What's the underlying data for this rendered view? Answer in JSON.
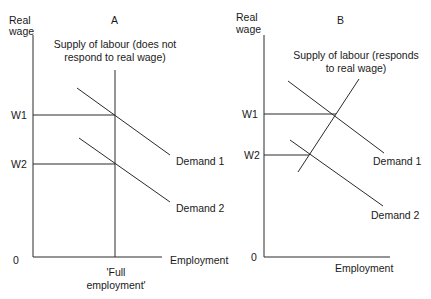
{
  "panels": [
    {
      "id": "A",
      "title": "A",
      "y_axis_label_line1": "Real",
      "y_axis_label_line2": "wage",
      "x_axis_label": "Employment",
      "origin_label": "0",
      "wage_labels": [
        "W1",
        "W2"
      ],
      "supply_label_line1": "Supply of labour (does not",
      "supply_label_line2": "respond to real wage)",
      "demand_labels": [
        "Demand 1",
        "Demand 2"
      ],
      "full_employment_line1": "'Full",
      "full_employment_line2": "employment'"
    },
    {
      "id": "B",
      "title": "B",
      "y_axis_label_line1": "Real",
      "y_axis_label_line2": "wage",
      "x_axis_label": "Employment",
      "origin_label": "0",
      "wage_labels": [
        "W1",
        "W2"
      ],
      "supply_label_line1": "Supply of labour (responds",
      "supply_label_line2": "to real wage)",
      "demand_labels": [
        "Demand 1",
        "Demand 2"
      ]
    }
  ],
  "colors": {
    "line": "#2a2a2a",
    "text": "#1a1a1a",
    "background": "#ffffff"
  }
}
